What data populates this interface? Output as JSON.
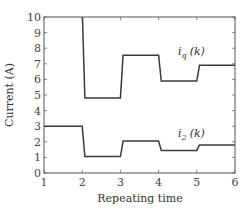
{
  "chart_data": {
    "type": "line",
    "title": "",
    "xlabel": "Repeating time",
    "ylabel": "Current (A)",
    "xlim": [
      1,
      6
    ],
    "ylim": [
      0,
      10
    ],
    "xticks": [
      1,
      2,
      3,
      4,
      5,
      6
    ],
    "yticks": [
      0,
      1,
      2,
      3,
      4,
      5,
      6,
      7,
      8,
      9,
      10
    ],
    "grid": false,
    "step": true,
    "series": [
      {
        "name": "iq(k)",
        "label_main": "i",
        "label_sub": "q",
        "label_arg": "(k)",
        "x": [
          1,
          2,
          3,
          4,
          5,
          6
        ],
        "values": [
          10.5,
          4.8,
          7.55,
          5.9,
          6.9,
          6.9
        ],
        "note": "k=1 value exceeds plot top (>10)"
      },
      {
        "name": "i2(k)",
        "label_main": "i",
        "label_sub": "2",
        "label_arg": "(k)",
        "x": [
          1,
          2,
          3,
          4,
          5,
          6
        ],
        "values": [
          3.0,
          1.05,
          2.05,
          1.45,
          1.8,
          1.8
        ]
      }
    ]
  },
  "plot": {
    "ylabel": "Current (A)",
    "xlabel": "Repeating time"
  }
}
